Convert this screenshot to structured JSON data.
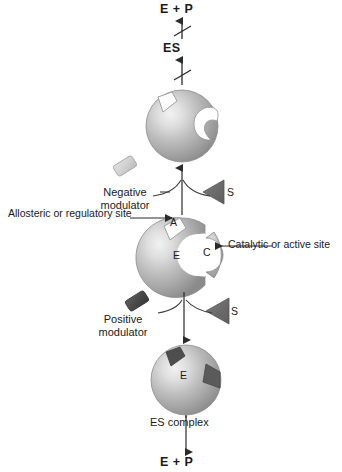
{
  "diagram": {
    "type": "biochemistry-schematic"
  },
  "colors": {
    "sphere_light": "#e9e9e9",
    "sphere_mid": "#b9b9b9",
    "sphere_dark": "#8f8f8f",
    "sphere_edge": "#6f6f6f",
    "negative_modulator": "#d0d0d0",
    "positive_modulator": "#4a4a4a",
    "substrate": "#6a6a6a",
    "line": "#3a3a3a",
    "text": "#1a1a1a",
    "background": "#ffffff"
  },
  "labels": {
    "products_top": "E + P",
    "es_middle": "ES",
    "negative_modulator": "Negative\nmodulator",
    "negative_modulator_line1": "Negative",
    "negative_modulator_line2": "modulator",
    "substrate_upper": "S",
    "allosteric_site": "Allosteric or regulatory site",
    "catalytic_site": "Catalytic or active site",
    "positive_modulator_line1": "Positive",
    "positive_modulator_line2": "modulator",
    "substrate_lower": "S",
    "es_complex": "ES complex",
    "products_bottom": "E + P"
  },
  "site_marks": {
    "allosteric_letter": "A",
    "enzyme_letter_middle": "E",
    "catalytic_letter": "C",
    "enzyme_letter_bottom": "E"
  },
  "pathways": [
    {
      "name": "inhibited-pathway",
      "modulator": "Negative modulator",
      "modulator_shape": "rhombus",
      "modulator_fill": "light-gray",
      "result": "distorted active site",
      "blocked": true,
      "arrow_marks": "slashed",
      "outputs": [
        "ES",
        "E + P"
      ]
    },
    {
      "name": "activated-pathway",
      "modulator": "Positive modulator",
      "modulator_shape": "rhombus",
      "modulator_fill": "dark-gray",
      "result": "ES complex",
      "blocked": false,
      "arrow_marks": "plain",
      "outputs": [
        "ES complex",
        "E + P"
      ]
    }
  ],
  "shapes": {
    "enzyme_top": {
      "name": "enzyme-distorted",
      "allosteric_notch": "empty-angular",
      "catalytic_site": "distorted-cavity"
    },
    "enzyme_middle": {
      "name": "enzyme-free",
      "allosteric_notch": "angular-open",
      "catalytic_site": "round-open"
    },
    "enzyme_bottom": {
      "name": "enzyme-substrate-complex",
      "allosteric_notch": "filled-dark",
      "catalytic_site": "filled-dark-wedge"
    }
  }
}
